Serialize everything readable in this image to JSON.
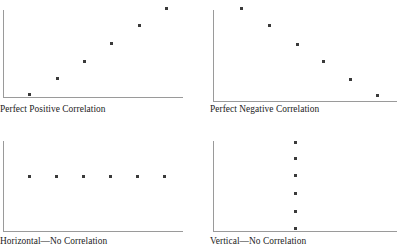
{
  "figure": {
    "title": "",
    "background": "#ffffff",
    "axis_color": "#9a9a9a",
    "dot_color": "#3a3a3a",
    "text_color": "#1c1c1c"
  },
  "panels": [
    {
      "id": "perfect-positive",
      "caption": "Perfect Positive Correlation",
      "caption_x": 0,
      "caption_y": 104,
      "axis": {
        "x": 3,
        "y_top": 10,
        "y_bottom": 97,
        "x_right": 183
      },
      "points": [
        {
          "x": 29,
          "y": 94
        },
        {
          "x": 57,
          "y": 78
        },
        {
          "x": 84,
          "y": 61
        },
        {
          "x": 111,
          "y": 43
        },
        {
          "x": 139,
          "y": 25
        },
        {
          "x": 166,
          "y": 8
        }
      ]
    },
    {
      "id": "perfect-negative",
      "caption": "Perfect Negative Correlation",
      "caption_x": 0,
      "caption_y": 104,
      "axis": {
        "x": 3,
        "y_top": 10,
        "y_bottom": 101,
        "x_right": 187
      },
      "points": [
        {
          "x": 31,
          "y": 8
        },
        {
          "x": 59,
          "y": 25
        },
        {
          "x": 87,
          "y": 44
        },
        {
          "x": 113,
          "y": 61
        },
        {
          "x": 140,
          "y": 79
        },
        {
          "x": 167,
          "y": 95
        }
      ]
    },
    {
      "id": "horizontal-no-correlation",
      "caption": "Horizontal—No Correlation",
      "caption_x": 0,
      "caption_y": 106,
      "axis": {
        "x": 3,
        "y_top": 11,
        "y_bottom": 101,
        "x_right": 183
      },
      "points": [
        {
          "x": 29,
          "y": 46
        },
        {
          "x": 56,
          "y": 46
        },
        {
          "x": 83,
          "y": 46
        },
        {
          "x": 110,
          "y": 46
        },
        {
          "x": 137,
          "y": 46
        },
        {
          "x": 164,
          "y": 46
        }
      ]
    },
    {
      "id": "vertical-no-correlation",
      "caption": "Vertical—No Correlation",
      "caption_x": 0,
      "caption_y": 106,
      "axis": {
        "x": 3,
        "y_top": 11,
        "y_bottom": 101,
        "x_right": 187
      },
      "points": [
        {
          "x": 85,
          "y": 12
        },
        {
          "x": 85,
          "y": 28
        },
        {
          "x": 85,
          "y": 45
        },
        {
          "x": 85,
          "y": 63
        },
        {
          "x": 85,
          "y": 81
        },
        {
          "x": 85,
          "y": 98
        }
      ]
    }
  ],
  "chart_data": {
    "type": "scatter",
    "xlabel": "",
    "ylabel": "",
    "grid": false,
    "legend": "none",
    "axes_shown": "left-and-bottom-spines-only",
    "tick_labels": {
      "x": [],
      "y": []
    },
    "panel_layout": "2x2",
    "charts": [
      {
        "id": "perfect-positive",
        "title": "Perfect Positive Correlation",
        "type": "scatter",
        "n_points": 6,
        "x": [
          1,
          2,
          3,
          4,
          5,
          6
        ],
        "y": [
          1,
          2,
          3,
          4,
          5,
          6
        ],
        "xlim": [
          0,
          7
        ],
        "ylim": [
          0,
          7
        ],
        "description": "Six points rising in a straight line from lower-left to upper-right"
      },
      {
        "id": "perfect-negative",
        "title": "Perfect Negative Correlation",
        "type": "scatter",
        "n_points": 6,
        "x": [
          1,
          2,
          3,
          4,
          5,
          6
        ],
        "y": [
          6,
          5,
          4,
          3,
          2,
          1
        ],
        "xlim": [
          0,
          7
        ],
        "ylim": [
          0,
          7
        ],
        "description": "Six points falling in a straight line from upper-left to lower-right"
      },
      {
        "id": "horizontal-no-correlation",
        "title": "Horizontal—No Correlation",
        "type": "scatter",
        "n_points": 6,
        "x": [
          1,
          2,
          3,
          4,
          5,
          6
        ],
        "y": [
          3.5,
          3.5,
          3.5,
          3.5,
          3.5,
          3.5
        ],
        "xlim": [
          0,
          7
        ],
        "ylim": [
          0,
          7
        ],
        "description": "Six points evenly spaced along a horizontal line at constant y"
      },
      {
        "id": "vertical-no-correlation",
        "title": "Vertical—No Correlation",
        "type": "scatter",
        "n_points": 6,
        "x": [
          3.5,
          3.5,
          3.5,
          3.5,
          3.5,
          3.5
        ],
        "y": [
          1,
          2,
          3,
          4,
          5,
          6
        ],
        "xlim": [
          0,
          7
        ],
        "ylim": [
          0,
          7
        ],
        "description": "Six points evenly spaced along a vertical line at constant x"
      }
    ]
  }
}
